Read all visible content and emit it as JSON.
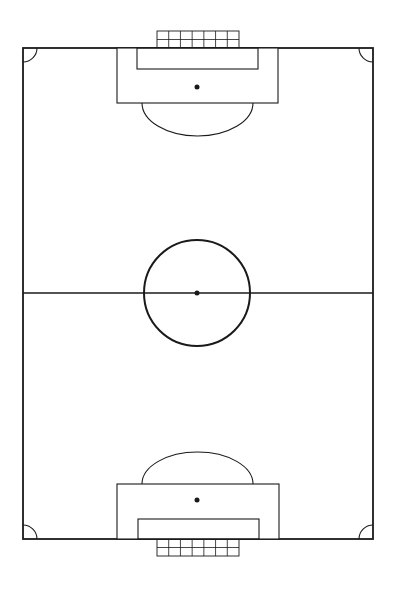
{
  "diagram": {
    "type": "soccer-pitch",
    "orientation": "vertical",
    "colors": {
      "background": "#ffffff",
      "line": "#1a1a1a"
    },
    "field": {
      "x": 23,
      "y": 48,
      "width": 350,
      "height": 491
    },
    "halfway_line_y": 293,
    "center_circle": {
      "cx": 197,
      "cy": 293,
      "r": 53
    },
    "center_spot": {
      "cx": 197,
      "cy": 293,
      "r": 2.5
    },
    "corner_arc_radius": 14,
    "top_end": {
      "penalty_area": {
        "x": 117,
        "y": 48,
        "width": 161,
        "height": 55
      },
      "goal_area": {
        "x": 137,
        "y": 48,
        "width": 121,
        "height": 21
      },
      "penalty_spot": {
        "cx": 197,
        "cy": 87,
        "r": 2.5
      },
      "penalty_arc": {
        "x1": 142,
        "x2": 253,
        "y": 103,
        "depth": 33
      },
      "goal_net": {
        "x": 157,
        "y": 31,
        "width": 82,
        "height": 17,
        "columns": 7,
        "rows": 2
      }
    },
    "bottom_end": {
      "penalty_area": {
        "x": 117,
        "y": 484,
        "width": 162,
        "height": 55
      },
      "goal_area": {
        "x": 138,
        "y": 519,
        "width": 121,
        "height": 20
      },
      "penalty_spot": {
        "cx": 197,
        "cy": 500,
        "r": 2.5
      },
      "penalty_arc": {
        "x1": 142,
        "x2": 253,
        "y": 484,
        "depth": 32
      },
      "goal_net": {
        "x": 157,
        "y": 539,
        "width": 82,
        "height": 17,
        "columns": 7,
        "rows": 2
      }
    }
  }
}
